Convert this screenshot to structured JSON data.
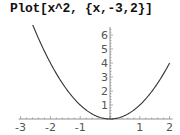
{
  "input": {
    "command": "Plot[x^2, {x,-3,2}]"
  },
  "chart_data": {
    "type": "line",
    "title": "Plot[x^2, {x,-3,2}]",
    "function": "x^2",
    "xrange": [
      -3,
      2
    ],
    "ylim": [
      0,
      6.5
    ],
    "xlabel": "",
    "ylabel": "",
    "grid": false,
    "legend": null,
    "x_ticks": [
      "-3",
      "-2",
      "-1",
      "1",
      "2"
    ],
    "y_ticks": [
      "1",
      "2",
      "3",
      "4",
      "5",
      "6"
    ],
    "series": [
      {
        "name": "x^2",
        "x": [
          -3,
          -2.5,
          -2,
          -1.5,
          -1,
          -0.5,
          0,
          0.5,
          1,
          1.5,
          2
        ],
        "y": [
          9,
          6.25,
          4,
          2.25,
          1,
          0.25,
          0,
          0.25,
          1,
          2.25,
          4
        ]
      }
    ],
    "colors": {
      "curve": "#333333",
      "axes": "#777777",
      "labels": "#555555"
    }
  }
}
